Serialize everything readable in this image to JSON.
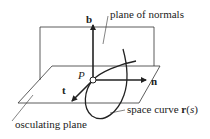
{
  "labels": {
    "binormal": "b",
    "normal": "n",
    "tangent": "t",
    "point": "P",
    "plane_of_normals": "plane of normals",
    "osculating_plane": "osculating plane",
    "space_curve_prefix": "space curve ",
    "space_curve_func": "r",
    "space_curve_arg_open": "(",
    "space_curve_arg": "s",
    "space_curve_arg_close": ")"
  },
  "colors": {
    "stroke": "#222222",
    "background": "#ffffff"
  }
}
